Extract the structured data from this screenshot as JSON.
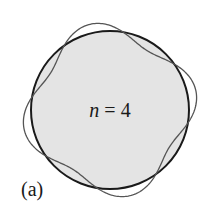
{
  "figure": {
    "panel_label": "(a)",
    "mode_label": {
      "variable": "n",
      "equals": " = ",
      "value": "4"
    },
    "circle": {
      "cx": 110,
      "cy": 110,
      "r": 79,
      "fill": "#e4e4e4",
      "stroke": "#1a1a1a",
      "stroke_width": 2
    },
    "standing_wave": {
      "n": 4,
      "amplitude": 9,
      "phase_deg": 257,
      "stroke": "#555555",
      "stroke_width": 1.3
    }
  }
}
